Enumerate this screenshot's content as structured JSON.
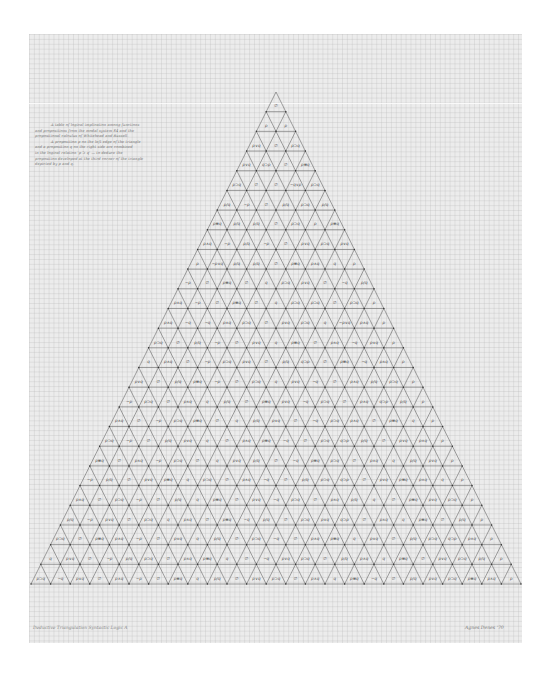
{
  "artwork": {
    "description_note": [
      "A table of logical implication among functions",
      "and propositions from the modal system S4 and the",
      "propositional calculus of Whitehead and Russell.",
      "A proposition p on the left edge of the triangle",
      "and a proposition q on the right side are combined",
      "in the logical relation 'p ⊃ q' — to deduce the",
      "proposition developed at the third corner of the triangle",
      "depicted by p and q."
    ],
    "caption": "Deductive Triangulation  Syntactic Logic A",
    "signature": "Agnes Denes  '70",
    "colors": {
      "paper": "#ececec",
      "grid": "#c8c8c8",
      "lines": "#5a5a5a",
      "ink": "#555555"
    }
  },
  "triangle": {
    "rows": 25,
    "apex": [
      276,
      92
    ],
    "base_y": 584,
    "base_left_x": 31,
    "base_right_x": 521
  },
  "cells": [
    [
      "∅"
    ],
    [
      "p",
      "p"
    ],
    [
      "p∨q",
      "∅",
      "p⊃q"
    ],
    [
      "p∨q",
      "q⊃p",
      "∅",
      "p≡q"
    ],
    [
      "p⊃q",
      "∅",
      "∅",
      "~q∨p",
      "p⊃q"
    ],
    [
      "p/q",
      "~p",
      "∅",
      "p/q",
      "p⊃q",
      "p/q"
    ],
    [
      "p≡q",
      "p/q",
      "p/q",
      "∅",
      "p⊃q",
      "p",
      "p≡q"
    ],
    [
      "p∧q",
      "~p",
      "p/q",
      "~p",
      "∅",
      "p∨q",
      "p⊃q",
      "p∨q"
    ],
    [
      "p",
      "~p∨q",
      "p/q",
      "p/q",
      "∅",
      "p≡q",
      "p∧q",
      "q",
      "p"
    ],
    [
      "~p",
      "∅",
      "p≡q",
      "∅",
      "q",
      "p⊃q",
      "p∨q",
      "∅",
      "~q",
      "p/q"
    ],
    [
      "p∧q",
      "~p",
      "∅",
      "p≡q",
      "∅",
      "q",
      "p⊃q",
      "p⊃q",
      "∅",
      "p⊃q",
      "p"
    ],
    [
      "p∧q",
      "~q",
      "~q",
      "p∧q",
      "p⊃q",
      "∅",
      "p∨q",
      "p⊃q",
      "q",
      "~p∨q",
      "p∧q",
      "p"
    ],
    [
      "p⊃q",
      "∅",
      "p/q",
      "~p",
      "∅",
      "p∨q",
      "q",
      "p≡q",
      "∅",
      "p∧q",
      "~q",
      "p∨q",
      "p"
    ],
    [
      "q",
      "p∧q",
      "∅",
      "~p",
      "p⊃q",
      "p∨q",
      "∅",
      "p/q",
      "q⊃p",
      "∅",
      "p≡q",
      "~q",
      "p∧q",
      "p"
    ],
    [
      "p∨q",
      "∅",
      "p/q",
      "p≡q",
      "~p",
      "∅",
      "p⊃q",
      "q",
      "p∨q",
      "~q",
      "∅",
      "p∧q",
      "p/q",
      "p⊃q",
      "p"
    ],
    [
      "~p",
      "p⊃q",
      "∅",
      "p∧q",
      "q",
      "p/q",
      "∅",
      "p≡q",
      "p∨q",
      "~q",
      "p⊃q",
      "∅",
      "p∧q",
      "q⊃p",
      "p/q",
      "p"
    ],
    [
      "p∧q",
      "∅",
      "~p",
      "p⊃q",
      "p≡q",
      "∅",
      "q",
      "p/q",
      "p∨q",
      "∅",
      "~q",
      "p⊃q",
      "p∧q",
      "∅",
      "p≡q",
      "q",
      "p"
    ],
    [
      "p⊃q",
      "~p",
      "∅",
      "p/q",
      "p∨q",
      "q",
      "∅",
      "p∧q",
      "p≡q",
      "~q",
      "∅",
      "p⊃q",
      "q⊃p",
      "p/q",
      "∅",
      "p∨q",
      "p∧q",
      "p"
    ],
    [
      "p≡q",
      "∅",
      "p∧q",
      "~p",
      "p⊃q",
      "∅",
      "q",
      "p∨q",
      "p/q",
      "∅",
      "~q",
      "p≡q",
      "p⊃q",
      "∅",
      "p∧q",
      "q",
      "p/q",
      "p∨q",
      "p"
    ],
    [
      "~p",
      "p/q",
      "∅",
      "p∨q",
      "p≡q",
      "q",
      "p⊃q",
      "∅",
      "p∧q",
      "~q",
      "∅",
      "p/q",
      "p⊃q",
      "q⊃p",
      "∅",
      "p∨q",
      "p≡q",
      "p∧q",
      "q",
      "p"
    ],
    [
      "p∧q",
      "∅",
      "p⊃q",
      "~p",
      "∅",
      "p/q",
      "q",
      "p≡q",
      "∅",
      "p∨q",
      "~q",
      "p⊃q",
      "∅",
      "p∧q",
      "p/q",
      "q",
      "∅",
      "p≡q",
      "p∨q",
      "p⊃q",
      "p"
    ],
    [
      "p/q",
      "~p",
      "p∨q",
      "∅",
      "p⊃q",
      "q",
      "p∧q",
      "∅",
      "p≡q",
      "~q",
      "p/q",
      "∅",
      "p⊃q",
      "p∨q",
      "q⊃p",
      "∅",
      "p∧q",
      "q",
      "p≡q",
      "∅",
      "p/q",
      "p"
    ],
    [
      "p⊃q",
      "∅",
      "p≡q",
      "p∧q",
      "~p",
      "∅",
      "p∨q",
      "q",
      "p/q",
      "∅",
      "p⊃q",
      "~q",
      "∅",
      "p∧q",
      "p≡q",
      "q",
      "p∨q",
      "∅",
      "p/q",
      "p⊃q",
      "q⊃p",
      "p∧q",
      "p"
    ],
    [
      "q",
      "p∨q",
      "∅",
      "~p",
      "p/q",
      "p⊃q",
      "∅",
      "p∧q",
      "p≡q",
      "q",
      "∅",
      "~q",
      "p∨q",
      "p⊃q",
      "∅",
      "p/q",
      "p∧q",
      "q",
      "p≡q",
      "∅",
      "p∨q",
      "p⊃q",
      "p/q",
      "p"
    ],
    [
      "p⊃q",
      "~q",
      "p∨q",
      "∅",
      "p∧q",
      "~p",
      "∅",
      "p≡q",
      "q",
      "p/q",
      "∅",
      "p∨q",
      "p⊃q",
      "∅",
      "p∧q",
      "q",
      "p≡q",
      "~q",
      "∅",
      "p/q",
      "p∨q",
      "p⊃q",
      "p≡q",
      "p∧q",
      "p"
    ]
  ]
}
